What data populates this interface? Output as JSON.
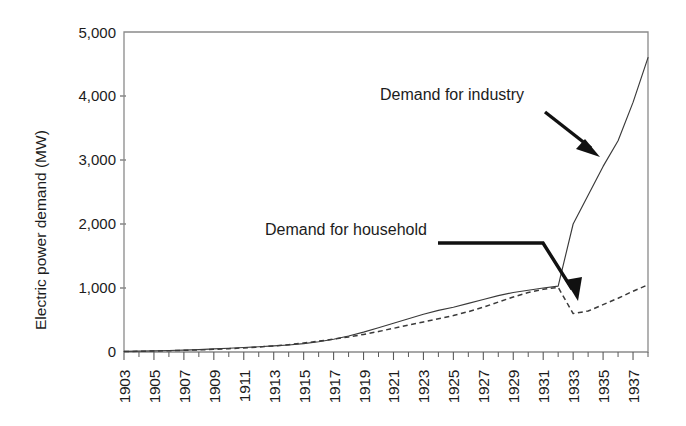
{
  "chart_data": {
    "type": "line",
    "title": "",
    "xlabel": "",
    "ylabel": "Electric  power demand (MW)",
    "xlim": [
      1903,
      1938
    ],
    "ylim": [
      0,
      5000
    ],
    "grid": false,
    "legend_position": "none",
    "y_ticks": [
      "0",
      "1,000",
      "2,000",
      "3,000",
      "4,000",
      "5,000"
    ],
    "y_tick_values": [
      0,
      1000,
      2000,
      3000,
      4000,
      5000
    ],
    "x_ticks": [
      "1903",
      "1905",
      "1907",
      "1909",
      "1911",
      "1913",
      "1915",
      "1917",
      "1919",
      "1921",
      "1923",
      "1925",
      "1927",
      "1929",
      "1931",
      "1933",
      "1935",
      "1937"
    ],
    "x_tick_values": [
      1903,
      1905,
      1907,
      1909,
      1911,
      1913,
      1915,
      1917,
      1919,
      1921,
      1923,
      1925,
      1927,
      1929,
      1931,
      1933,
      1935,
      1937
    ],
    "x_minor_step": 1,
    "series": [
      {
        "name": "Demand for industry",
        "style": "solid",
        "color": "#3a3a3a",
        "x": [
          1903,
          1904,
          1905,
          1906,
          1907,
          1908,
          1909,
          1910,
          1911,
          1912,
          1913,
          1914,
          1915,
          1916,
          1917,
          1918,
          1919,
          1920,
          1921,
          1922,
          1923,
          1924,
          1925,
          1926,
          1927,
          1928,
          1929,
          1930,
          1931,
          1932,
          1933,
          1934,
          1935,
          1936,
          1937,
          1938
        ],
        "values": [
          10,
          14,
          18,
          24,
          30,
          38,
          48,
          58,
          70,
          82,
          95,
          110,
          130,
          160,
          200,
          250,
          310,
          380,
          450,
          520,
          590,
          650,
          700,
          760,
          820,
          880,
          930,
          965,
          1000,
          1030,
          2000,
          2450,
          2900,
          3300,
          3900,
          4600
        ]
      },
      {
        "name": "Demand for household",
        "style": "dashed",
        "color": "#3a3a3a",
        "x": [
          1903,
          1904,
          1905,
          1906,
          1907,
          1908,
          1909,
          1910,
          1911,
          1912,
          1913,
          1914,
          1915,
          1916,
          1917,
          1918,
          1919,
          1920,
          1921,
          1922,
          1923,
          1924,
          1925,
          1926,
          1927,
          1928,
          1929,
          1930,
          1931,
          1932,
          1933,
          1934,
          1935,
          1936,
          1937,
          1938
        ],
        "values": [
          8,
          11,
          15,
          20,
          26,
          33,
          42,
          52,
          64,
          78,
          95,
          115,
          140,
          170,
          200,
          235,
          275,
          320,
          370,
          420,
          470,
          520,
          570,
          630,
          700,
          780,
          860,
          930,
          980,
          1010,
          600,
          640,
          740,
          840,
          950,
          1050
        ]
      }
    ],
    "annotations": [
      {
        "text": "Demand for industry",
        "style": "straight-arrow",
        "label_x": 380,
        "label_y": 100,
        "arrow_from": [
          545,
          112
        ],
        "arrow_to": [
          597,
          153
        ]
      },
      {
        "text": "Demand for household",
        "style": "elbow-arrow",
        "label_x": 265,
        "label_y": 235,
        "arrow_from": [
          438,
          243
        ],
        "arrow_elbow": [
          543,
          243
        ],
        "arrow_to": [
          578,
          298
        ]
      }
    ]
  }
}
